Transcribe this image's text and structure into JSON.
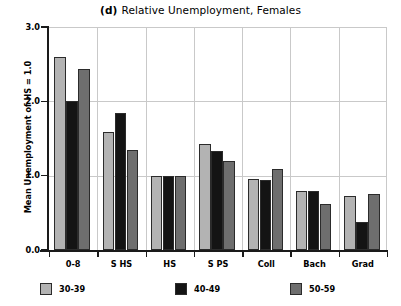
{
  "chart_data": {
    "type": "bar",
    "panel_letter": "(d)",
    "title": "Relative Unemployment, Females",
    "xlabel": "",
    "ylabel": "Mean Unemployment of HS = 1.0",
    "categories": [
      "0-8",
      "S HS",
      "HS",
      "S PS",
      "Coll",
      "Bach",
      "Grad"
    ],
    "series": [
      {
        "name": "30-39",
        "color": "#b3b3b3",
        "values": [
          2.59,
          1.59,
          1.0,
          1.43,
          0.95,
          0.79,
          0.73
        ]
      },
      {
        "name": "40-49",
        "color": "#141414",
        "values": [
          2.0,
          1.84,
          1.0,
          1.33,
          0.94,
          0.79,
          0.38
        ]
      },
      {
        "name": "50-59",
        "color": "#6e6e6e",
        "values": [
          2.44,
          1.35,
          1.0,
          1.2,
          1.09,
          0.62,
          0.75
        ]
      }
    ],
    "ylim": [
      0.0,
      3.0
    ],
    "yticks": [
      "0.0",
      "1.0",
      "2.0",
      "3.0"
    ],
    "ytick_values": [
      0.0,
      1.0,
      2.0,
      3.0
    ],
    "grid": "horizontal-and-group-separators",
    "legend_position": "bottom"
  },
  "legend": {
    "entries": [
      {
        "label": "30-39",
        "color": "#b3b3b3"
      },
      {
        "label": "40-49",
        "color": "#141414"
      },
      {
        "label": "50-59",
        "color": "#6e6e6e"
      }
    ]
  }
}
